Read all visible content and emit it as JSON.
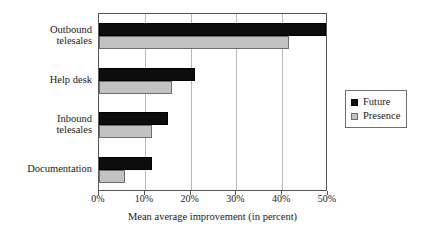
{
  "chart_data": {
    "type": "bar",
    "orientation": "horizontal",
    "title": "",
    "xlabel": "Mean average improvement (in percent)",
    "ylabel": "",
    "xlim": [
      0,
      50
    ],
    "xticks": [
      "0%",
      "10%",
      "20%",
      "30%",
      "40%",
      "50%"
    ],
    "xtick_values": [
      0,
      10,
      20,
      30,
      40,
      50
    ],
    "grid": true,
    "legend_position": "right",
    "categories": [
      "Outbound telesales",
      "Help desk",
      "Inbound telesales",
      "Documentation"
    ],
    "category_lines": [
      [
        "Outbound",
        "telesales"
      ],
      [
        "Help desk"
      ],
      [
        "Inbound",
        "telesales"
      ],
      [
        "Documentation"
      ]
    ],
    "series": [
      {
        "name": "Future",
        "color": "#0d0d0d",
        "values": [
          49.5,
          21.0,
          15.0,
          11.5
        ]
      },
      {
        "name": "Presence",
        "color": "#c2c2c2",
        "values": [
          41.5,
          16.0,
          11.5,
          5.7
        ]
      }
    ]
  },
  "legend": {
    "items": [
      {
        "label": "Future",
        "swatch": "black-square-icon"
      },
      {
        "label": "Presence",
        "swatch": "gray-square-icon"
      }
    ]
  }
}
